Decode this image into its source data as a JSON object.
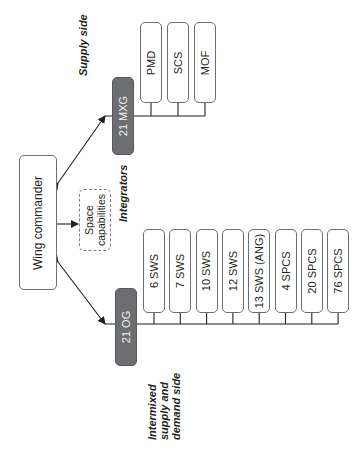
{
  "title_labels": {
    "supply_side": "Supply side",
    "integrators": "Integrators",
    "intermixed": [
      "Intermixed",
      "supply and",
      "demand side"
    ]
  },
  "nodes": {
    "wing_commander": "Wing commander",
    "space_capabilities": [
      "Space",
      "capabilities"
    ],
    "mxg": "21 MXG",
    "og": "21 OG"
  },
  "mxg_children": [
    "PMD",
    "SCS",
    "MOF"
  ],
  "og_children": [
    "6 SWS",
    "7 SWS",
    "10 SWS",
    "12 SWS",
    "13 SWS (ANG)",
    "4 SPCS",
    "20 SPCS",
    "76 SPCS"
  ],
  "colors": {
    "group_fill": "#6d6e71",
    "line": "#231f20"
  }
}
